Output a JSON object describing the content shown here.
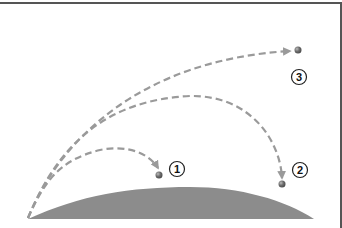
{
  "diagram": {
    "type": "projectile-trajectories",
    "ground": {
      "color": "#8c8c8c",
      "left": [
        28,
        219
      ],
      "right": [
        314,
        219
      ],
      "peak_y": 187
    },
    "path_color": "#9a9a9a",
    "ball_color": "#6e6e6e",
    "trajectories": [
      {
        "id": "1",
        "label": "1",
        "path": "M28,218 C45,180 60,160 100,150 C130,144 150,155 158,168",
        "ball": [
          159,
          175
        ],
        "label_pos": [
          177,
          169
        ]
      },
      {
        "id": "2",
        "label": "2",
        "path": "M28,218 C60,140 110,100 190,96 C250,95 280,140 282,178",
        "ball": [
          282,
          184
        ],
        "label_pos": [
          300,
          170
        ]
      },
      {
        "id": "3",
        "label": "3",
        "path": "M28,218 C60,140 140,60 290,51",
        "ball": [
          298,
          50
        ],
        "label_pos": [
          299,
          77
        ]
      }
    ]
  }
}
